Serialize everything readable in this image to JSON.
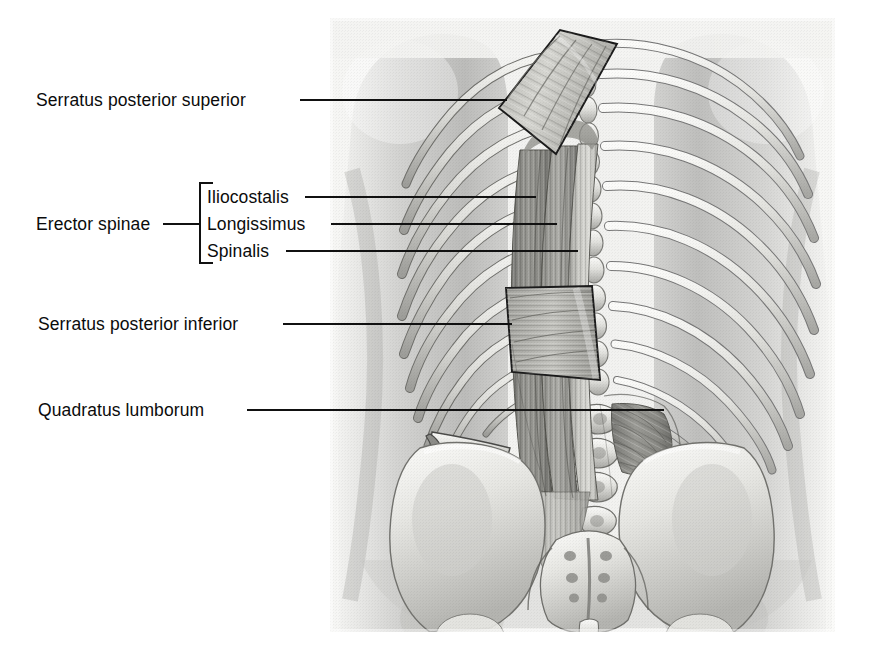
{
  "figure": {
    "view": "posterior",
    "style": "grayscale medical illustration",
    "panel": {
      "x": 330,
      "y": 18,
      "width": 505,
      "height": 614
    },
    "background_color": "#ffffff",
    "panel_color": "#f2f2f0",
    "line_color": "#111111",
    "text_color": "#0b0b0b"
  },
  "labels": [
    {
      "id": "serratus-posterior-superior",
      "text": "Serratus posterior superior",
      "x": 36,
      "y": 92,
      "leader": {
        "x1": 300,
        "y1": 100,
        "x2": 507,
        "y2": 100
      }
    },
    {
      "id": "iliocostalis",
      "text": "Iliocostalis",
      "x": 207,
      "y": 189,
      "leader": {
        "x1": 305,
        "y1": 197,
        "x2": 536,
        "y2": 197
      }
    },
    {
      "id": "longissimus",
      "text": "Longissimus",
      "x": 207,
      "y": 216,
      "leader": {
        "x1": 331,
        "y1": 224,
        "x2": 557,
        "y2": 224
      }
    },
    {
      "id": "spinalis",
      "text": "Spinalis",
      "x": 207,
      "y": 243,
      "leader": {
        "x1": 286,
        "y1": 251,
        "x2": 578,
        "y2": 251
      }
    },
    {
      "id": "erector-spinae",
      "text": "Erector spinae",
      "x": 36,
      "y": 216,
      "leader": {
        "x1": 163,
        "y1": 224,
        "x2": 200,
        "y2": 224
      }
    },
    {
      "id": "serratus-posterior-inferior",
      "text": "Serratus posterior inferior",
      "x": 38,
      "y": 316,
      "leader": {
        "x1": 283,
        "y1": 324,
        "x2": 512,
        "y2": 324
      }
    },
    {
      "id": "quadratus-lumborum",
      "text": "Quadratus lumborum",
      "x": 38,
      "y": 402,
      "leader": {
        "x1": 247,
        "y1": 410,
        "x2": 664,
        "y2": 410
      }
    }
  ],
  "bracket": {
    "id": "erector-spinae-bracket",
    "x": 199,
    "top": 182,
    "bottom": 264,
    "tick_length": 14
  },
  "structures": [
    {
      "name": "serratus posterior superior",
      "kind": "muscle",
      "outlined": true
    },
    {
      "name": "serratus posterior inferior",
      "kind": "muscle",
      "outlined": true
    },
    {
      "name": "iliocostalis",
      "kind": "muscle"
    },
    {
      "name": "longissimus",
      "kind": "muscle"
    },
    {
      "name": "spinalis",
      "kind": "muscle"
    },
    {
      "name": "quadratus lumborum",
      "kind": "muscle"
    },
    {
      "name": "rib cage",
      "kind": "bone"
    },
    {
      "name": "vertebral column",
      "kind": "bone"
    },
    {
      "name": "sacrum",
      "kind": "bone"
    },
    {
      "name": "ilium",
      "kind": "bone"
    },
    {
      "name": "iliac crest",
      "kind": "bone"
    },
    {
      "name": "twelfth rib",
      "kind": "bone"
    },
    {
      "name": "body silhouette",
      "kind": "surface"
    }
  ]
}
